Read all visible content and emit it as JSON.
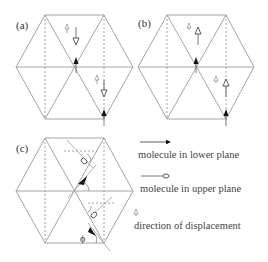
{
  "panels": [
    {
      "id": "a",
      "label": "(a)"
    },
    {
      "id": "b",
      "label": "(b)"
    },
    {
      "id": "c",
      "label": "(c)",
      "angle_label": "ϕ"
    }
  ],
  "legend": {
    "lower_plane": "molecule in lower plane",
    "upper_plane": "molecule in upper plane",
    "displacement": "direction of displacement"
  },
  "colors": {
    "lines": "#9a9a9a",
    "dashed": "#b0b0b0",
    "arrow_fill": "#111111",
    "text": "#444444"
  }
}
